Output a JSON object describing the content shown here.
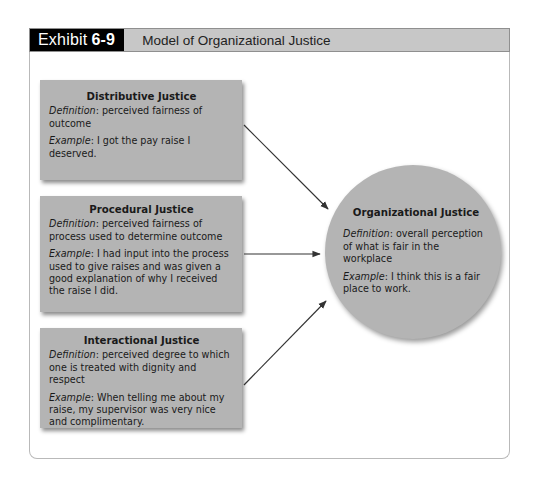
{
  "header": {
    "exhibit_label": "Exhibit",
    "exhibit_number": "6-9",
    "title": "Model of Organizational Justice"
  },
  "boxes": [
    {
      "title": "Distributive Justice",
      "definition_label": "Definition",
      "definition": ": perceived fairness of outcome",
      "example_label": "Example",
      "example": ": I got the pay raise I deserved."
    },
    {
      "title": "Procedural Justice",
      "definition_label": "Definition",
      "definition": ": perceived fairness of process used to determine outcome",
      "example_label": "Example",
      "example": ": I had input into the process used to give raises and was given a good explanation of why I received the raise I did."
    },
    {
      "title": "Interactional Justice",
      "definition_label": "Definition",
      "definition": ": perceived degree to which one is treated with dignity and respect",
      "example_label": "Example",
      "example": ": When telling me about my raise, my supervisor was very nice and complimentary."
    }
  ],
  "outcome": {
    "title": "Organizational Justice",
    "definition_label": "Definition",
    "definition": ": overall perception of what is fair in the workplace",
    "example_label": "Example",
    "example": ": I think this is a fair place to work."
  },
  "colors": {
    "header_bar": "#c7c7c7",
    "exhibit_tag": "#000000",
    "shape_fill": "#b4b4b4",
    "arrow": "#333333"
  }
}
